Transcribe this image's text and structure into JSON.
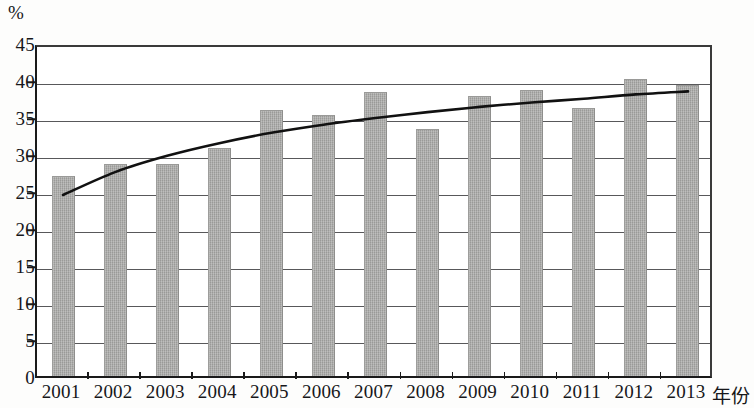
{
  "chart_data": {
    "type": "bar",
    "title": "",
    "subtitle": "",
    "xlabel": "年份",
    "ylabel": "%",
    "unit_label": "%",
    "categories": [
      "2001",
      "2002",
      "2003",
      "2004",
      "2005",
      "2006",
      "2007",
      "2008",
      "2009",
      "2010",
      "2011",
      "2012",
      "2013"
    ],
    "values": [
      27.0,
      28.6,
      28.6,
      30.8,
      36.0,
      35.3,
      38.4,
      33.4,
      37.8,
      38.6,
      36.2,
      40.1,
      39.3
    ],
    "ylim": [
      0,
      45
    ],
    "ytick_labels": [
      "0",
      "5",
      "10",
      "15",
      "20",
      "25",
      "30",
      "35",
      "40",
      "45"
    ],
    "yticks": [
      0,
      5,
      10,
      15,
      20,
      25,
      30,
      35,
      40,
      45
    ],
    "grid": true,
    "legend": "none",
    "series": [
      {
        "name": "bars",
        "type": "bar",
        "color": "#a9a9a7",
        "values": [
          27.0,
          28.6,
          28.6,
          30.8,
          36.0,
          35.3,
          38.4,
          33.4,
          37.8,
          38.6,
          36.2,
          40.1,
          39.3
        ]
      },
      {
        "name": "trend",
        "type": "line",
        "color": "#111111",
        "values": [
          25.0,
          28.1,
          30.3,
          32.0,
          33.4,
          34.5,
          35.4,
          36.2,
          36.9,
          37.5,
          38.0,
          38.6,
          39.0
        ]
      }
    ]
  }
}
